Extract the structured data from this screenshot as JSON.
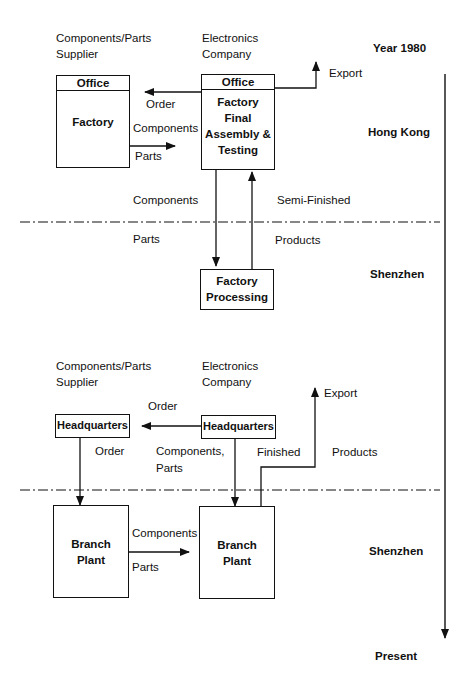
{
  "top_section": {
    "supplier_label": [
      "Components/Parts",
      "Supplier"
    ],
    "company_label": [
      "Electronics",
      "Company"
    ],
    "year_label": "Year 1980",
    "supplier_box": {
      "header": "Office",
      "body": "Factory"
    },
    "company_box": {
      "header": "Office",
      "body": [
        "Factory",
        "Final",
        "Assembly &",
        "Testing"
      ]
    },
    "flow_order": "Order",
    "flow_components": "Components",
    "flow_parts": "Parts",
    "export_label": "Export",
    "region_hk": "Hong Kong",
    "down_components": "Components",
    "down_parts": "Parts",
    "up_semi": "Semi-Finished",
    "up_products": "Products",
    "processing_box": [
      "Factory",
      "Processing"
    ],
    "region_sz": "Shenzhen"
  },
  "bottom_section": {
    "supplier_label": [
      "Components/Parts",
      "Supplier"
    ],
    "company_label": [
      "Electronics",
      "Company"
    ],
    "order_top": "Order",
    "supplier_hq": "Headquarters",
    "company_hq": "Headquarters",
    "order_down": "Order",
    "components_parts": [
      "Components,",
      "Parts"
    ],
    "finished": "Finished",
    "products": "Products",
    "export_label": "Export",
    "branch_left": [
      "Branch",
      "Plant"
    ],
    "branch_right": [
      "Branch",
      "Plant"
    ],
    "flow_components": "Components",
    "flow_parts": "Parts",
    "region_sz": "Shenzhen"
  },
  "timeline": {
    "start": "Year 1980",
    "end": "Present"
  }
}
